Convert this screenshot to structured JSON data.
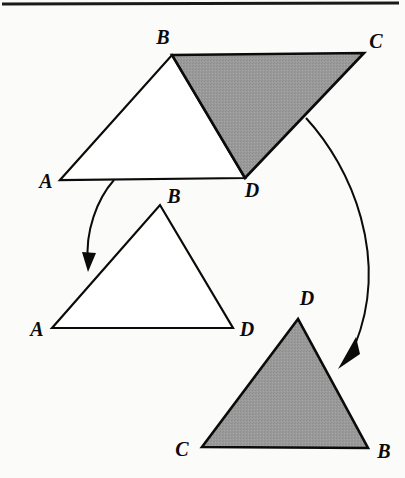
{
  "figure": {
    "name": "congruent-triangles-decomposition-figure",
    "background_color": "#fbfbfa",
    "stroke_color": "#0b0b0b",
    "shaded_fill": "#999999",
    "unshaded_fill": "#ffffff",
    "width": 405,
    "height": 478,
    "top_rule": {
      "x1": 2,
      "y1": 4,
      "x2": 399,
      "y2": 3,
      "thickness": 3
    }
  },
  "shapes": [
    {
      "id": "top-left-triangle-abd",
      "label": "triangle-abd-unshaded",
      "shaded": false,
      "fill": "#ffffff",
      "points": "60,180 172,55 245,178",
      "vertices": [
        {
          "name": "A",
          "x": 60,
          "y": 180
        },
        {
          "name": "B",
          "x": 172,
          "y": 55
        },
        {
          "name": "D",
          "x": 245,
          "y": 178
        }
      ]
    },
    {
      "id": "top-right-triangle-bcd",
      "label": "triangle-bcd-shaded",
      "shaded": true,
      "fill": "#999999",
      "points": "172,55 364,53 245,178",
      "vertices": [
        {
          "name": "B",
          "x": 172,
          "y": 55
        },
        {
          "name": "C",
          "x": 364,
          "y": 53
        },
        {
          "name": "D",
          "x": 245,
          "y": 178
        }
      ]
    },
    {
      "id": "middle-triangle-abd",
      "label": "triangle-abd-moved-unshaded",
      "shaded": false,
      "fill": "#ffffff",
      "points": "52,328 160,205 233,328",
      "vertices": [
        {
          "name": "A",
          "x": 52,
          "y": 328
        },
        {
          "name": "B",
          "x": 160,
          "y": 205
        },
        {
          "name": "D",
          "x": 233,
          "y": 328
        }
      ]
    },
    {
      "id": "bottom-triangle-cdb",
      "label": "triangle-dcb-moved-shaded",
      "shaded": true,
      "fill": "#999999",
      "points": "298,319 202,447 368,448",
      "vertices": [
        {
          "name": "D",
          "x": 298,
          "y": 319
        },
        {
          "name": "C",
          "x": 202,
          "y": 447
        },
        {
          "name": "B",
          "x": 368,
          "y": 448
        }
      ]
    }
  ],
  "labels": [
    {
      "id": "label-top-a",
      "text": "A",
      "x": 46,
      "y": 188,
      "anchor": "middle",
      "shape": "top-left-triangle-abd",
      "vertex": "A"
    },
    {
      "id": "label-top-b",
      "text": "B",
      "x": 163,
      "y": 44,
      "anchor": "middle",
      "shape": "top-left-triangle-abd",
      "vertex": "B"
    },
    {
      "id": "label-top-c",
      "text": "C",
      "x": 376,
      "y": 48,
      "anchor": "middle",
      "shape": "top-right-triangle-bcd",
      "vertex": "C"
    },
    {
      "id": "label-top-d",
      "text": "D",
      "x": 252,
      "y": 197,
      "anchor": "middle",
      "shape": "top-left-triangle-abd",
      "vertex": "D"
    },
    {
      "id": "label-mid-a",
      "text": "A",
      "x": 37,
      "y": 336,
      "anchor": "middle",
      "shape": "middle-triangle-abd",
      "vertex": "A"
    },
    {
      "id": "label-mid-b",
      "text": "B",
      "x": 174,
      "y": 203,
      "anchor": "middle",
      "shape": "middle-triangle-abd",
      "vertex": "B"
    },
    {
      "id": "label-mid-d",
      "text": "D",
      "x": 247,
      "y": 336,
      "anchor": "middle",
      "shape": "middle-triangle-abd",
      "vertex": "D"
    },
    {
      "id": "label-bot-d",
      "text": "D",
      "x": 307,
      "y": 305,
      "anchor": "middle",
      "shape": "bottom-triangle-cdb",
      "vertex": "D"
    },
    {
      "id": "label-bot-c",
      "text": "C",
      "x": 182,
      "y": 456,
      "anchor": "middle",
      "shape": "bottom-triangle-cdb",
      "vertex": "C"
    },
    {
      "id": "label-bot-b",
      "text": "B",
      "x": 384,
      "y": 458,
      "anchor": "middle",
      "shape": "bottom-triangle-cdb",
      "vertex": "B"
    }
  ],
  "arrows": [
    {
      "id": "arrow-left",
      "label": "move-arrow-unshaded-triangle",
      "path": "M 114,180 C 97,199 85,232 88,262",
      "head": "M 88,272 L 82,252 L 96,253 Z",
      "from_shape": "top-left-triangle-abd",
      "to_shape": "middle-triangle-abd"
    },
    {
      "id": "arrow-right",
      "label": "move-arrow-shaded-triangle",
      "path": "M 306,118 C 352,168 390,258 355,345",
      "head": "M 338,369 L 356,337 L 360,354 Z",
      "from_shape": "top-right-triangle-bcd",
      "to_shape": "bottom-triangle-cdb"
    }
  ]
}
